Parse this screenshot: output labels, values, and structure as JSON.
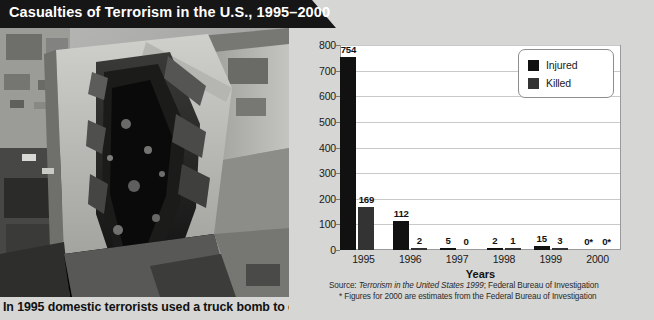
{
  "header": {
    "title": "Casualties of Terrorism in the U.S., 1995–2000"
  },
  "photo": {
    "alt_name": "bombed-federal-building-aerial-photo",
    "caption": "In 1995 domestic terrorists used a truck bomb to destroy"
  },
  "chart_data": {
    "type": "bar",
    "title": "Casualties of Terrorism in the U.S., 1995–2000",
    "xlabel": "Years",
    "ylabel": "",
    "categories": [
      "1995",
      "1996",
      "1997",
      "1998",
      "1999",
      "2000"
    ],
    "ylim": [
      0,
      800
    ],
    "yticks": [
      0,
      100,
      200,
      300,
      400,
      500,
      600,
      700,
      800
    ],
    "ytick_labels": [
      "0",
      "100",
      "200",
      "300",
      "400",
      "500",
      "600",
      "700",
      "800"
    ],
    "grid": true,
    "legend_position": "top-right",
    "series": [
      {
        "name": "Injured",
        "color": "#111111",
        "values": [
          754,
          112,
          5,
          2,
          15,
          0
        ],
        "labels": [
          "754",
          "112",
          "5",
          "2",
          "15",
          "0*"
        ]
      },
      {
        "name": "Killed",
        "color": "#333333",
        "values": [
          169,
          2,
          0,
          1,
          3,
          0
        ],
        "labels": [
          "169",
          "2",
          "0",
          "1",
          "3",
          "0*"
        ]
      }
    ],
    "annotations": [
      "Source: Terrorism in the United States 1999; Federal Bureau of Investigation",
      "* Figures for 2000 are estimates from the Federal Bureau of Investigation"
    ]
  },
  "source": {
    "line1_prefix": "Source: ",
    "line1_italic": "Terrorism in the United States 1999",
    "line1_suffix": "; Federal Bureau of Investigation",
    "line2": "* Figures for 2000 are estimates from the Federal Bureau of Investigation"
  }
}
